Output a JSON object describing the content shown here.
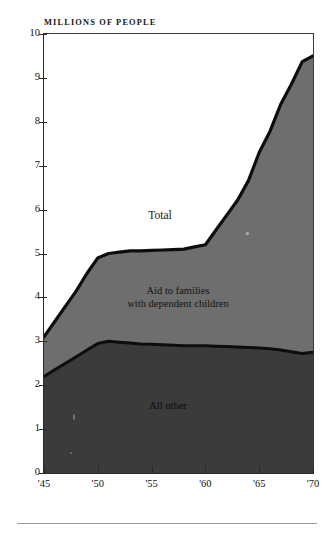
{
  "figure": {
    "top_caption": "",
    "unit_label": "MILLIONS OF PEOPLE",
    "footer_note": ""
  },
  "chart_data": {
    "type": "area",
    "stacked": true,
    "title": "",
    "subtitle": "",
    "xlabel": "",
    "ylabel": "MILLIONS OF PEOPLE",
    "ylim": [
      0,
      10
    ],
    "xlim": [
      1945,
      1970
    ],
    "grid": false,
    "legend_position": "inline-annotations",
    "y_ticks": [
      0,
      1,
      2,
      3,
      4,
      5,
      6,
      7,
      8,
      9,
      10
    ],
    "y_tick_labels": [
      "0",
      "1",
      "2",
      "3",
      "4",
      "5",
      "6",
      "7",
      "8",
      "9",
      "10"
    ],
    "x_ticks": [
      1945,
      1950,
      1955,
      1960,
      1965,
      1970
    ],
    "x_tick_labels": [
      "'45",
      "'50",
      "'55",
      "'60",
      "'65",
      "'70"
    ],
    "x": [
      1945,
      1946,
      1947,
      1948,
      1949,
      1950,
      1951,
      1952,
      1953,
      1954,
      1955,
      1956,
      1957,
      1958,
      1959,
      1960,
      1961,
      1962,
      1963,
      1964,
      1965,
      1966,
      1967,
      1968,
      1969,
      1970
    ],
    "series": [
      {
        "name": "All other",
        "label": "All other",
        "color": "#3b3b3b",
        "values": [
          2.2,
          2.35,
          2.5,
          2.65,
          2.8,
          2.95,
          3.0,
          2.98,
          2.96,
          2.94,
          2.93,
          2.92,
          2.91,
          2.9,
          2.9,
          2.9,
          2.89,
          2.88,
          2.87,
          2.86,
          2.85,
          2.83,
          2.8,
          2.76,
          2.72,
          2.75
        ]
      },
      {
        "name": "Aid to families with dependent children",
        "label": "Aid to families\nwith dependent children",
        "color": "#6e6e6e",
        "values": [
          0.9,
          1.1,
          1.3,
          1.5,
          1.75,
          1.95,
          2.0,
          2.05,
          2.1,
          2.12,
          2.14,
          2.16,
          2.18,
          2.2,
          2.25,
          2.3,
          2.65,
          3.0,
          3.35,
          3.8,
          4.45,
          4.95,
          5.6,
          6.1,
          6.65,
          6.75
        ]
      }
    ],
    "totals": {
      "name": "Total",
      "label": "Total",
      "values": [
        3.1,
        3.45,
        3.8,
        4.15,
        4.55,
        4.9,
        5.0,
        5.03,
        5.06,
        5.06,
        5.07,
        5.08,
        5.09,
        5.1,
        5.15,
        5.2,
        5.54,
        5.88,
        6.22,
        6.66,
        7.3,
        7.78,
        8.4,
        8.86,
        9.37,
        9.5
      ]
    },
    "annotations": [
      {
        "text": "Total",
        "x": 1955.5,
        "y": 6.0
      },
      {
        "text": "Aid to families with dependent children",
        "x": 1957.5,
        "y": 4.15
      },
      {
        "text": "All other",
        "x": 1956.5,
        "y": 1.6
      }
    ]
  },
  "axis_labels": {
    "y": [
      "10",
      "9",
      "8",
      "7",
      "6",
      "5",
      "4",
      "3",
      "2",
      "1",
      "0"
    ],
    "x": [
      "'45",
      "'50",
      "'55",
      "'60",
      "'65",
      "'70"
    ]
  },
  "colors": {
    "band_top": "#ffffff",
    "band_afdc": "#6e6e6e",
    "band_allother": "#3b3b3b",
    "line": "#0d0d0d",
    "axis": "#2a2a2a"
  }
}
